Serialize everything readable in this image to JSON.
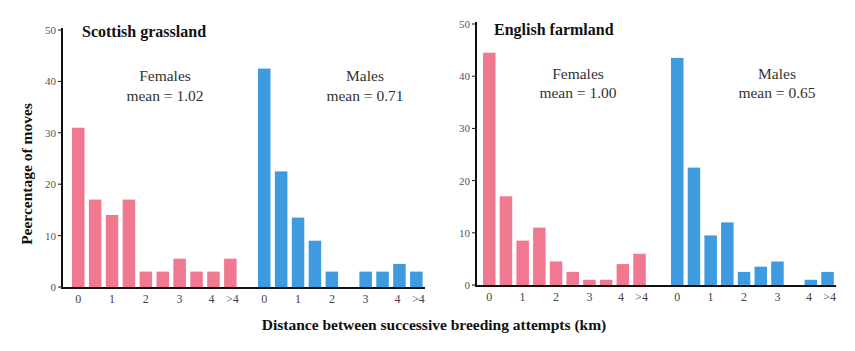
{
  "figure": {
    "ylabel": "Peercentage of moves",
    "xlabel": "Distance between successive breeding attempts (km)",
    "colors": {
      "females": "#f07890",
      "males": "#3f9be0",
      "axis": "#111111"
    }
  },
  "panels": [
    {
      "title": "Scottish grassland",
      "females": {
        "label": "Females",
        "mean_text": "mean = 1.02"
      },
      "males": {
        "label": "Males",
        "mean_text": "mean = 0.71"
      }
    },
    {
      "title": "English farmland",
      "females": {
        "label": "Females",
        "mean_text": "mean = 1.00"
      },
      "males": {
        "label": "Males",
        "mean_text": "mean = 0.65"
      }
    }
  ],
  "chart_data": [
    {
      "type": "bar",
      "title": "Scottish grassland",
      "xlabel": "Distance between successive breeding attempts (km)",
      "ylabel": "Peercentage of moves",
      "ylim": [
        0,
        50
      ],
      "yticks": [
        0,
        10,
        20,
        30,
        40,
        50
      ],
      "categories": [
        "0",
        "0.5",
        "1",
        "1.5",
        "2",
        "2.5",
        "3",
        "3.5",
        "4",
        ">4"
      ],
      "xtick_labels": [
        "0",
        "1",
        "2",
        "3",
        "4",
        ">4"
      ],
      "series": [
        {
          "name": "Females",
          "mean": 1.02,
          "color": "#f07890",
          "values": [
            31,
            17,
            14,
            17,
            3,
            3,
            5.5,
            3,
            3,
            5.5
          ]
        },
        {
          "name": "Males",
          "mean": 0.71,
          "color": "#3f9be0",
          "values": [
            42.5,
            22.5,
            13.5,
            9,
            3,
            0,
            3,
            3,
            4.5,
            3
          ]
        }
      ],
      "grid": false
    },
    {
      "type": "bar",
      "title": "English farmland",
      "xlabel": "Distance between successive breeding attempts (km)",
      "ylabel": "Peercentage of moves",
      "ylim": [
        0,
        50
      ],
      "yticks": [
        0,
        10,
        20,
        30,
        40,
        50
      ],
      "categories": [
        "0",
        "0.5",
        "1",
        "1.5",
        "2",
        "2.5",
        "3",
        "3.5",
        "4",
        ">4"
      ],
      "xtick_labels": [
        "0",
        "1",
        "2",
        "3",
        "4",
        ">4"
      ],
      "series": [
        {
          "name": "Females",
          "mean": 1.0,
          "color": "#f07890",
          "values": [
            44.5,
            17,
            8.5,
            11,
            4.5,
            2.5,
            1,
            1,
            4,
            6
          ]
        },
        {
          "name": "Males",
          "mean": 0.65,
          "color": "#3f9be0",
          "values": [
            43.5,
            22.5,
            9.5,
            12,
            2.5,
            3.5,
            4.5,
            0,
            1,
            2.5
          ]
        }
      ],
      "grid": false
    }
  ]
}
